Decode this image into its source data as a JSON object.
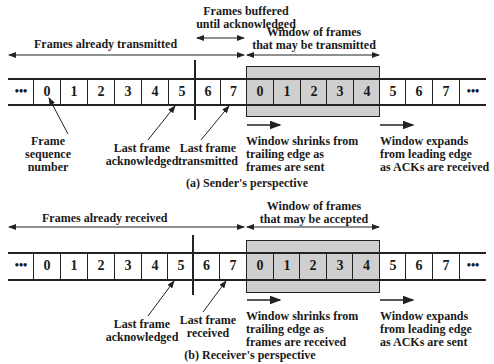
{
  "sender": {
    "caption": "(a) Sender's perspective",
    "span_labels": {
      "already": "Frames already transmitted",
      "buffered_line1": "Frames buffered",
      "buffered_line2": "until acknowledged",
      "window_line1": "Window of frames",
      "window_line2": "that may be transmitted"
    },
    "cells": [
      "•••",
      "0",
      "1",
      "2",
      "3",
      "4",
      "5",
      "6",
      "7",
      "0",
      "1",
      "2",
      "3",
      "4",
      "5",
      "6",
      "7",
      "•••"
    ],
    "annotations": {
      "seq_line1": "Frame",
      "seq_line2": "sequence",
      "seq_line3": "number",
      "ack_line1": "Last frame",
      "ack_line2": "acknowledged",
      "last_line1": "Last frame",
      "last_line2": "transmitted",
      "shrink_line1": "Window shrinks from",
      "shrink_line2": "trailing edge as",
      "shrink_line3": "frames are sent",
      "expand_line1": "Window expands",
      "expand_line2": "from leading edge",
      "expand_line3": "as ACKs are received"
    }
  },
  "receiver": {
    "caption": "(b) Receiver's perspective",
    "span_labels": {
      "already": "Frames already received",
      "window_line1": "Window of frames",
      "window_line2": "that may be accepted"
    },
    "cells": [
      "•••",
      "0",
      "1",
      "2",
      "3",
      "4",
      "5",
      "6",
      "7",
      "0",
      "1",
      "2",
      "3",
      "4",
      "5",
      "6",
      "7",
      "•••"
    ],
    "annotations": {
      "ack_line1": "Last frame",
      "ack_line2": "acknowledged",
      "last_line1": "Last frame",
      "last_line2": "received",
      "shrink_line1": "Window shrinks from",
      "shrink_line2": "trailing edge as",
      "shrink_line3": "frames are received",
      "expand_line1": "Window expands",
      "expand_line2": "from leading edge",
      "expand_line3": "as ACKs are sent"
    }
  },
  "colors": {
    "window_fill": "#cfcfcf",
    "line": "#222222"
  }
}
